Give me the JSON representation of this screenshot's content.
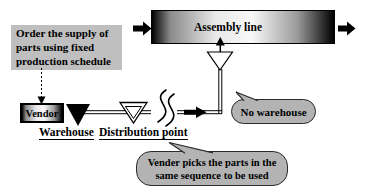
{
  "diagram_type": "supply-chain-flow",
  "order_box": {
    "lines": [
      "Order the supply of",
      "parts using fixed",
      "production schedule"
    ]
  },
  "assembly_line": {
    "label": "Assembly line"
  },
  "vendor": {
    "label": "Vendor"
  },
  "labels": {
    "warehouse": "Warehouse",
    "distribution_point": "Distribution point"
  },
  "bubbles": {
    "no_warehouse": "No warehouse",
    "vender_picks": {
      "lines": [
        "Vender picks the parts in the",
        "same sequence to be used"
      ]
    }
  },
  "markers": {
    "warehouse_marker": "filled-down-triangle",
    "distribution_marker": "outlined-nested-down-triangle",
    "funnel_marker": "outlined-down-triangle",
    "line_break": "squiggle",
    "flow_arrows": "black-block-arrow-right",
    "schedule_link": "dashed-down-arrow"
  },
  "colors": {
    "background": "#ffffff",
    "order_box_fill": "#bfbfbf",
    "bubble_fill": "#b3b3b3",
    "bubble_border": "#2b2b2b",
    "gradient_dark": "#000000",
    "gradient_light": "#f8f8f8",
    "line": "#000000",
    "text": "#000000"
  }
}
